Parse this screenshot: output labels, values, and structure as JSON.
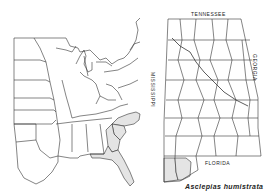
{
  "figure": {
    "caption": "Asclepias humistrata",
    "colors": {
      "outline": "#333333",
      "shaded": "#e4e4e4",
      "background": "#ffffff"
    }
  },
  "us_map": {
    "title": "",
    "shaded_states": [
      "North Carolina",
      "South Carolina",
      "Georgia",
      "Florida"
    ]
  },
  "alabama_map": {
    "border_labels": {
      "north": "TENNESSEE",
      "south": "FLORIDA",
      "west": "MISSISSIPPI",
      "east": "GEORGIA"
    },
    "shaded_counties": [
      "Mobile",
      "Baldwin"
    ]
  }
}
